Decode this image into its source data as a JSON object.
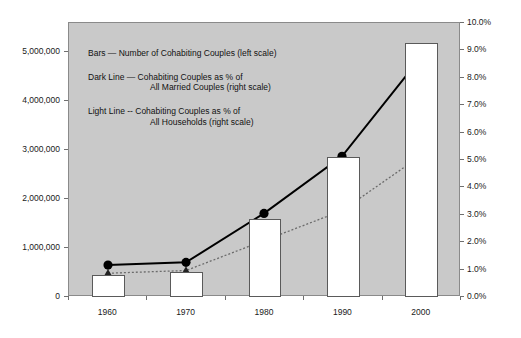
{
  "chart_data": {
    "type": "bar",
    "title": "",
    "subtitle": "",
    "xlabel": "",
    "ylabel": "",
    "y2label": "",
    "categories": [
      "1960",
      "1970",
      "1980",
      "1990",
      "2000"
    ],
    "grid": false,
    "legend_position": "inside-upper-left",
    "left_axis": {
      "ticks": [
        "0",
        "1,000,000",
        "2,000,000",
        "3,000,000",
        "4,000,000",
        "5,000,000"
      ],
      "tick_values": [
        0,
        1000000,
        2000000,
        3000000,
        4000000,
        5000000
      ],
      "min": 0,
      "max": 5600000
    },
    "right_axis": {
      "ticks": [
        "0.0%",
        "1.0%",
        "2.0%",
        "3.0%",
        "4.0%",
        "5.0%",
        "6.0%",
        "7.0%",
        "8.0%",
        "9.0%",
        "10.0%"
      ],
      "tick_values": [
        0,
        1,
        2,
        3,
        4,
        5,
        6,
        7,
        8,
        9,
        10
      ],
      "min": 0,
      "max": 10
    },
    "series": [
      {
        "name": "Bars — Number of Cohabiting Couples (left scale)",
        "type": "bar",
        "axis": "left",
        "fill": "#ffffff",
        "stroke": "#5a5a5a",
        "values": [
          450000,
          520000,
          1600000,
          2860000,
          5200000
        ]
      },
      {
        "name": "Dark Line — Cohabiting Couples as % of All Married Couples (right scale)",
        "type": "line",
        "axis": "right",
        "marker": "circle",
        "stroke": "#000000",
        "dash": "solid",
        "values": [
          1.1,
          1.2,
          3.0,
          5.1,
          8.7
        ]
      },
      {
        "name": "Light Line -- Cohabiting Couples as % of All Households (right scale)",
        "type": "line",
        "axis": "right",
        "marker": "triangle",
        "stroke": "#6b6b6b",
        "dash": "dotted",
        "values": [
          0.8,
          0.9,
          2.0,
          3.1,
          5.1
        ]
      }
    ]
  },
  "legend": {
    "bars_entry": "Bars — Number of Cohabiting Couples (left scale)",
    "dark_line_entry_line1": "Dark Line  — Cohabiting Couples as % of",
    "dark_line_entry_line2": "All Married Couples (right scale)",
    "light_line_entry_line1": "Light Line -- Cohabiting Couples as % of",
    "light_line_entry_line2": "All Households (right scale)"
  },
  "colors": {
    "plot_background": "#c9c9c9",
    "page_background": "#ffffff",
    "bar_fill": "#ffffff",
    "bar_stroke": "#5a5a5a",
    "dark_line": "#000000",
    "light_line": "#6b6b6b",
    "axis": "#6f6f6f",
    "text": "#111111"
  }
}
